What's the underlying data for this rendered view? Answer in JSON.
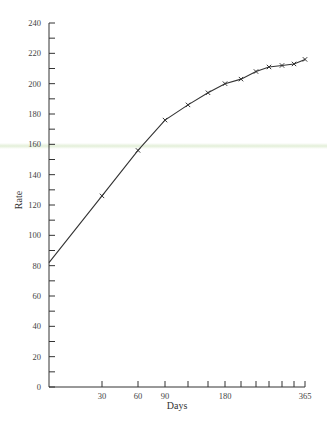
{
  "chart_data": {
    "type": "line",
    "title": "",
    "xlabel": "Days",
    "ylabel": "Rate",
    "ylim": [
      0,
      240
    ],
    "y_ticks": [
      0,
      20,
      40,
      60,
      80,
      100,
      120,
      140,
      160,
      180,
      200,
      220,
      240
    ],
    "x_tick_positions": [
      30,
      60,
      90,
      120,
      150,
      180,
      210,
      240,
      270,
      300,
      330,
      365
    ],
    "x_tick_labels": [
      "30",
      "60",
      "90",
      "",
      "",
      "180",
      "",
      "",
      "",
      "",
      "",
      "365"
    ],
    "grid": false,
    "legend": null,
    "marker": "x",
    "series": [
      {
        "name": "Rate",
        "x": [
          0,
          30,
          60,
          90,
          120,
          150,
          180,
          210,
          240,
          270,
          300,
          330,
          365
        ],
        "y": [
          82,
          126,
          156,
          176,
          186,
          194,
          200,
          203,
          208,
          211,
          212,
          213,
          216
        ],
        "markers_on": [
          false,
          true,
          true,
          true,
          true,
          true,
          true,
          true,
          true,
          true,
          true,
          true,
          true
        ]
      }
    ]
  },
  "pixel_map": {
    "x_axis_px": [
      49,
      102,
      138,
      165,
      188,
      208,
      225,
      241,
      256,
      269,
      282,
      294,
      305
    ],
    "y_zero_px": 387,
    "y_top_px": 23
  },
  "colors": {
    "axis": "#333333",
    "line": "#333333",
    "marker": "#333333"
  }
}
